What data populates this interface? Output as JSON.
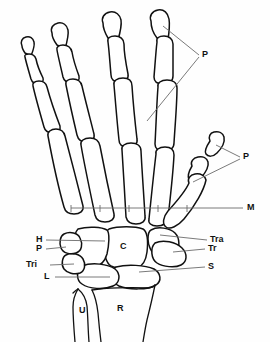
{
  "figure": {
    "background_color": "#fefefe",
    "bone_outline_color": "#111111",
    "leader_line_color": "#6b6b6b"
  },
  "labels": {
    "phalanges_fingers": "P",
    "phalanges_thumb": "P",
    "metacarpals": "M",
    "trapezium": "Tra",
    "trapezoid": "Tr",
    "scaphoid": "S",
    "capitate": "C",
    "hamate": "H",
    "pisiform": "P",
    "triquetrum": "Tri",
    "lunate": "L",
    "ulna": "U",
    "radius": "R"
  }
}
